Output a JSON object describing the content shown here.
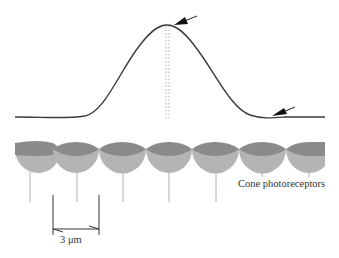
{
  "diagram": {
    "labels": {
      "cones": "Cone photoreceptors",
      "scale_bar": "3 μm"
    },
    "curve": {
      "type": "gaussian-like profile",
      "peak_x": 167,
      "peak_y": 25,
      "baseline_y": 117,
      "color": "#333333"
    },
    "arrows": [
      {
        "name": "peak-arrow",
        "points_to": "peak of curve"
      },
      {
        "name": "trough-arrow",
        "points_to": "first minimum / tail of curve"
      }
    ],
    "cones": {
      "count": 7,
      "colors": {
        "outer": "#8a8a8a",
        "inner": "#b4b4b4",
        "stem": "#b0b0b0"
      },
      "items": [
        {
          "center_x": 30,
          "stem": "long"
        },
        {
          "center_x": 77,
          "stem": "long"
        },
        {
          "center_x": 123,
          "stem": "long"
        },
        {
          "center_x": 169,
          "stem": "long"
        },
        {
          "center_x": 216,
          "stem": "long"
        },
        {
          "center_x": 262,
          "stem": "short"
        },
        {
          "center_x": 309,
          "stem": "short"
        }
      ]
    },
    "scale_bar": {
      "left_x": 53,
      "right_x": 99,
      "value": "3 μm"
    }
  }
}
